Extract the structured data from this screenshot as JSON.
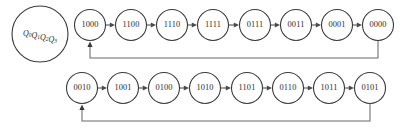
{
  "diagram": {
    "register": {
      "name": "register-node",
      "bits": [
        "Q",
        "Q",
        "Q",
        "Q"
      ],
      "subscripts": [
        "0",
        "1",
        "2",
        "3"
      ],
      "label": "Q0Q1Q2Q3",
      "center_x": 40,
      "center_y": 34,
      "radius": 28
    },
    "colors": {
      "stroke": "#3a3a3a",
      "edge": "#4a4a4a",
      "feedback": "#6a6a6a",
      "node_fill": "#ffffff",
      "text": "#2e2e2e",
      "background": "#ffffff"
    },
    "geometry": {
      "node_radius": 15.5,
      "top_row_y": 25,
      "bottom_row_y": 88,
      "first_node_x": 90,
      "node_spacing": 41.2,
      "top_feedback_y": 58,
      "bottom_feedback_y": 121
    },
    "rows": [
      {
        "name": "top-row",
        "id": "top",
        "y": 25,
        "nodes": [
          {
            "label": "1000",
            "x": 90
          },
          {
            "label": "1100",
            "x": 131
          },
          {
            "label": "1110",
            "x": 172
          },
          {
            "label": "1111",
            "x": 213
          },
          {
            "label": "0111",
            "x": 255
          },
          {
            "label": "0011",
            "x": 296
          },
          {
            "label": "0001",
            "x": 337
          },
          {
            "label": "0000",
            "x": 378
          }
        ],
        "feedback": {
          "from": "0000",
          "to": "1000",
          "from_x": 378,
          "to_x": 90,
          "drop_y": 58
        }
      },
      {
        "name": "bottom-row",
        "id": "bottom",
        "y": 88,
        "nodes": [
          {
            "label": "0010",
            "x": 82
          },
          {
            "label": "1001",
            "x": 123
          },
          {
            "label": "0100",
            "x": 164
          },
          {
            "label": "1010",
            "x": 205
          },
          {
            "label": "1101",
            "x": 247
          },
          {
            "label": "0110",
            "x": 288
          },
          {
            "label": "1011",
            "x": 329
          },
          {
            "label": "0101",
            "x": 370
          }
        ],
        "feedback": {
          "from": "0101",
          "to": "0010",
          "from_x": 370,
          "to_x": 82,
          "drop_y": 121
        }
      }
    ]
  }
}
